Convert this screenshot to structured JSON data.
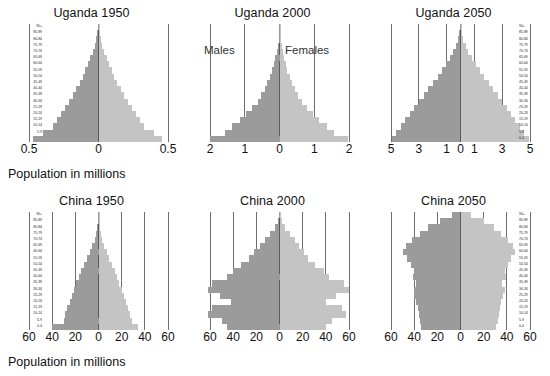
{
  "figure": {
    "caption_top": "Population in millions",
    "caption_bottom": "Population in millions",
    "colors": {
      "male": "#9b9b9b",
      "female": "#c4c4c4",
      "grid": "#6e6e6e",
      "text": "#111111"
    },
    "sex_labels": {
      "males": "Males",
      "females": "Females"
    }
  },
  "age_groups": [
    "0-4",
    "5-9",
    "10-14",
    "15-19",
    "20-24",
    "25-29",
    "30-34",
    "35-39",
    "40-44",
    "45-49",
    "50-54",
    "55-59",
    "60-64",
    "65-69",
    "70-74",
    "75-79",
    "80-84",
    "85-89",
    "90+"
  ],
  "chart_data": [
    {
      "type": "bar",
      "title": "Uganda 1950",
      "xlabel": "Population in millions",
      "ylabel": "",
      "xlim": [
        -0.5,
        0.5
      ],
      "ticks": [
        "0.5",
        "0",
        "0.5"
      ],
      "tick_values": [
        -0.5,
        0,
        0.5
      ],
      "grid": true,
      "legend": null,
      "categories": [
        "0-4",
        "5-9",
        "10-14",
        "15-19",
        "20-24",
        "25-29",
        "30-34",
        "35-39",
        "40-44",
        "45-49",
        "50-54",
        "55-59",
        "60-64",
        "65-69",
        "70-74",
        "75-79",
        "80-84",
        "85-89",
        "90+"
      ],
      "series": [
        {
          "name": "Males",
          "values": [
            0.47,
            0.4,
            0.33,
            0.3,
            0.27,
            0.24,
            0.21,
            0.185,
            0.16,
            0.135,
            0.115,
            0.095,
            0.075,
            0.058,
            0.042,
            0.028,
            0.016,
            0.008,
            0.003
          ]
        },
        {
          "name": "Females",
          "values": [
            0.46,
            0.4,
            0.33,
            0.3,
            0.27,
            0.24,
            0.21,
            0.185,
            0.16,
            0.135,
            0.115,
            0.095,
            0.075,
            0.058,
            0.042,
            0.028,
            0.016,
            0.008,
            0.003
          ]
        }
      ]
    },
    {
      "type": "bar",
      "title": "Uganda 2000",
      "xlabel": "Population in millions",
      "ylabel": "",
      "xlim": [
        -2,
        2
      ],
      "ticks": [
        "2",
        "1",
        "0",
        "1",
        "2"
      ],
      "tick_values": [
        -2,
        -1,
        0,
        1,
        2
      ],
      "grid": true,
      "legend": null,
      "categories": [
        "0-4",
        "5-9",
        "10-14",
        "15-19",
        "20-24",
        "25-29",
        "30-34",
        "35-39",
        "40-44",
        "45-49",
        "50-54",
        "55-59",
        "60-64",
        "65-69",
        "70-74",
        "75-79",
        "80-84",
        "85-89",
        "90+"
      ],
      "series": [
        {
          "name": "Males",
          "values": [
            2.0,
            1.58,
            1.37,
            1.15,
            0.95,
            0.78,
            0.63,
            0.52,
            0.43,
            0.35,
            0.28,
            0.22,
            0.17,
            0.125,
            0.085,
            0.052,
            0.028,
            0.012,
            0.004
          ]
        },
        {
          "name": "Females",
          "values": [
            1.98,
            1.57,
            1.36,
            1.14,
            0.95,
            0.79,
            0.64,
            0.53,
            0.44,
            0.36,
            0.29,
            0.23,
            0.18,
            0.135,
            0.095,
            0.058,
            0.032,
            0.014,
            0.005
          ]
        }
      ]
    },
    {
      "type": "bar",
      "title": "Uganda 2050",
      "xlabel": "Population in millions",
      "ylabel": "",
      "xlim": [
        -5,
        5
      ],
      "ticks": [
        "5",
        "3",
        "1",
        "0",
        "1",
        "3",
        "5"
      ],
      "tick_values": [
        -5,
        -3,
        -1,
        0,
        1,
        3,
        5
      ],
      "grid": true,
      "legend": null,
      "categories": [
        "0-4",
        "5-9",
        "10-14",
        "15-19",
        "20-24",
        "25-29",
        "30-34",
        "35-39",
        "40-44",
        "45-49",
        "50-54",
        "55-59",
        "60-64",
        "65-69",
        "70-74",
        "75-79",
        "80-84",
        "85-89",
        "90+"
      ],
      "series": [
        {
          "name": "Males",
          "values": [
            4.95,
            4.62,
            4.3,
            3.98,
            3.66,
            3.34,
            3.0,
            2.66,
            2.32,
            1.98,
            1.64,
            1.32,
            1.02,
            0.75,
            0.52,
            0.33,
            0.18,
            0.08,
            0.025
          ]
        },
        {
          "name": "Females",
          "values": [
            4.9,
            4.58,
            4.27,
            3.95,
            3.64,
            3.33,
            3.0,
            2.68,
            2.36,
            2.03,
            1.7,
            1.38,
            1.08,
            0.81,
            0.57,
            0.37,
            0.21,
            0.095,
            0.03
          ]
        }
      ]
    },
    {
      "type": "bar",
      "title": "China 1950",
      "xlabel": "Population in millions",
      "ylabel": "",
      "xlim": [
        -60,
        60
      ],
      "ticks": [
        "60",
        "40",
        "20",
        "0",
        "20",
        "40",
        "60"
      ],
      "tick_values": [
        -60,
        -40,
        -20,
        0,
        20,
        40,
        60
      ],
      "grid": true,
      "legend": null,
      "categories": [
        "0-4",
        "5-9",
        "10-14",
        "15-19",
        "20-24",
        "25-29",
        "30-34",
        "35-39",
        "40-44",
        "45-49",
        "50-54",
        "55-59",
        "60-64",
        "65-69",
        "70-74",
        "75-79",
        "80-84",
        "85-89",
        "90+"
      ],
      "series": [
        {
          "name": "Males",
          "values": [
            40.0,
            30.0,
            29.0,
            27.0,
            25.0,
            23.0,
            21.0,
            19.0,
            17.0,
            15.0,
            12.5,
            10.0,
            7.5,
            5.3,
            3.4,
            1.9,
            0.9,
            0.3,
            0.08
          ]
        },
        {
          "name": "Females",
          "values": [
            34.0,
            29.0,
            27.5,
            25.5,
            24.0,
            22.0,
            20.0,
            18.0,
            16.0,
            14.0,
            11.5,
            9.3,
            7.0,
            5.0,
            3.3,
            1.9,
            0.9,
            0.3,
            0.08
          ]
        }
      ]
    },
    {
      "type": "bar",
      "title": "China 2000",
      "xlabel": "Population in millions",
      "ylabel": "",
      "xlim": [
        -60,
        60
      ],
      "ticks": [
        "60",
        "40",
        "20",
        "0",
        "20",
        "40",
        "60"
      ],
      "tick_values": [
        -60,
        -40,
        -20,
        0,
        20,
        40,
        60
      ],
      "grid": true,
      "legend": null,
      "categories": [
        "0-4",
        "5-9",
        "10-14",
        "15-19",
        "20-24",
        "25-29",
        "30-34",
        "35-39",
        "40-44",
        "45-49",
        "50-54",
        "55-59",
        "60-64",
        "65-69",
        "70-74",
        "75-79",
        "80-84",
        "85-89",
        "90+"
      ],
      "series": [
        {
          "name": "Males",
          "values": [
            45.0,
            50.0,
            62.0,
            58.0,
            42.0,
            51.0,
            62.0,
            58.0,
            45.0,
            40.0,
            33.0,
            26.0,
            22.0,
            17.0,
            12.5,
            8.0,
            4.2,
            1.6,
            0.4
          ]
        },
        {
          "name": "Females",
          "values": [
            40.0,
            45.0,
            57.0,
            54.0,
            40.0,
            49.0,
            60.0,
            56.0,
            43.0,
            38.0,
            31.0,
            25.0,
            21.0,
            17.0,
            13.0,
            9.0,
            5.0,
            2.1,
            0.6
          ]
        }
      ]
    },
    {
      "type": "bar",
      "title": "China 2050",
      "xlabel": "Population in millions",
      "ylabel": "",
      "xlim": [
        -60,
        60
      ],
      "ticks": [
        "60",
        "40",
        "20",
        "0",
        "20",
        "40",
        "60"
      ],
      "tick_values": [
        -60,
        -40,
        -20,
        0,
        20,
        40,
        60
      ],
      "grid": true,
      "legend": null,
      "categories": [
        "0-4",
        "5-9",
        "10-14",
        "15-19",
        "20-24",
        "25-29",
        "30-34",
        "35-39",
        "40-44",
        "45-49",
        "50-54",
        "55-59",
        "60-64",
        "65-69",
        "70-74",
        "75-79",
        "80-84",
        "85-89",
        "90+"
      ],
      "series": [
        {
          "name": "Males",
          "values": [
            34.0,
            35.0,
            36.0,
            37.0,
            38.0,
            40.0,
            40.5,
            38.0,
            41.0,
            40.0,
            43.0,
            46.0,
            50.0,
            47.0,
            42.0,
            35.0,
            28.0,
            18.0,
            7.0
          ]
        },
        {
          "name": "Females",
          "values": [
            31.0,
            32.0,
            33.0,
            34.0,
            35.0,
            37.0,
            38.0,
            36.0,
            39.0,
            38.0,
            41.0,
            44.0,
            47.0,
            45.0,
            41.0,
            35.0,
            29.0,
            20.0,
            9.0
          ]
        }
      ]
    }
  ]
}
